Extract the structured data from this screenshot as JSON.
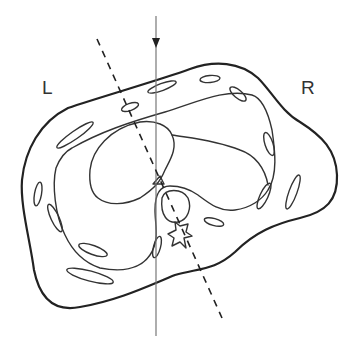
{
  "diagram": {
    "type": "anatomical cross-section (thorax)",
    "labels": {
      "left": "L",
      "right": "R"
    },
    "elements": {
      "body_outline": "body-contour",
      "chest_wall_inner": "pleural-contour",
      "heart": "heart",
      "vertebra": "vertebral-body",
      "ribs": 14,
      "beam_arrow": "vertical-beam-with-arrowhead",
      "oblique_line": "dashed-oblique-line"
    },
    "colors": {
      "line": "#222222",
      "beam": "#777777",
      "background": "#ffffff"
    }
  }
}
